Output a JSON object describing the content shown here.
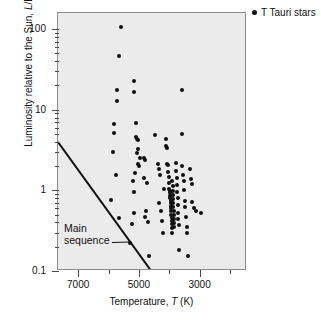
{
  "figure": {
    "background": "#ffffff",
    "plot_background": "#ebebeb",
    "frame_color": "#8c8c8c",
    "marker_color": "#111111"
  },
  "legend": {
    "position": "top-right-outside",
    "marker": "filled-circle",
    "label": "T Tauri stars"
  },
  "annotation": {
    "main_sequence": {
      "line1": "Main",
      "line2": "sequence"
    }
  },
  "chart_data": {
    "type": "scatter",
    "title": "",
    "subtitle": "",
    "xlabel": "Temperature, T (K)",
    "ylabel": "Luminosity relative to the Sun, L/L⊙",
    "xlabel_parts": {
      "pre": "Temperature, ",
      "italic": "T",
      "post": " (K)"
    },
    "ylabel_parts": {
      "pre": "Luminosity relative to the Sun, ",
      "italic": "L",
      "post": "/L⊙"
    },
    "xscale": "linear",
    "yscale": "log",
    "x_axis_reversed": true,
    "xlim": [
      7700,
      1470
    ],
    "ylim": [
      0.1,
      158
    ],
    "xticks": [
      7000,
      5000,
      3000
    ],
    "xtick_labels": [
      "7000",
      "5000",
      "3000"
    ],
    "xticks_minor": [
      6000,
      4000,
      2000
    ],
    "yticks": [
      100,
      10,
      1,
      0.1
    ],
    "ytick_labels": [
      "100",
      "10",
      "1",
      "0.1"
    ],
    "yticks_minor": [
      90,
      80,
      70,
      60,
      50,
      40,
      30,
      20,
      9,
      8,
      7,
      6,
      5,
      4,
      3,
      2,
      0.9,
      0.8,
      0.7,
      0.6,
      0.5,
      0.4,
      0.3,
      0.2
    ],
    "grid": false,
    "legend_position": "upper right, outside axes",
    "series": [
      {
        "name": "T Tauri stars",
        "marker": "filled-circle",
        "color": "#111111",
        "n_points": 108,
        "points": [
          [
            5630,
            105
          ],
          [
            5700,
            47
          ],
          [
            5760,
            17.5
          ],
          [
            5760,
            13.0
          ],
          [
            5840,
            5.2
          ],
          [
            5870,
            6.6
          ],
          [
            5900,
            3.0
          ],
          [
            5700,
            0.46
          ],
          [
            5790,
            1.55
          ],
          [
            5940,
            0.76
          ],
          [
            5200,
            23.0
          ],
          [
            5200,
            16.5
          ],
          [
            5130,
            6.9
          ],
          [
            5140,
            4.6
          ],
          [
            5110,
            4.3
          ],
          [
            5070,
            4.2
          ],
          [
            5050,
            3.3
          ],
          [
            5090,
            2.9
          ],
          [
            5000,
            2.5
          ],
          [
            5060,
            2.1
          ],
          [
            5020,
            2.0
          ],
          [
            5150,
            1.62
          ],
          [
            5230,
            1.3
          ],
          [
            5180,
            0.95
          ],
          [
            5210,
            0.52
          ],
          [
            5270,
            0.38
          ],
          [
            5330,
            0.22
          ],
          [
            4880,
            2.5
          ],
          [
            4820,
            2.4
          ],
          [
            4860,
            1.42
          ],
          [
            4760,
            1.25
          ],
          [
            4800,
            0.56
          ],
          [
            4830,
            0.47
          ],
          [
            4750,
            0.41
          ],
          [
            4710,
            0.155
          ],
          [
            4500,
            4.8
          ],
          [
            4420,
            2.1
          ],
          [
            4380,
            1.85
          ],
          [
            4330,
            1.55
          ],
          [
            4360,
            0.7
          ],
          [
            4300,
            0.55
          ],
          [
            4270,
            0.42
          ],
          [
            4250,
            0.3
          ],
          [
            4220,
            1.05
          ],
          [
            4150,
            4.3
          ],
          [
            4130,
            3.6
          ],
          [
            4100,
            3.4
          ],
          [
            4120,
            2.15
          ],
          [
            4080,
            2.05
          ],
          [
            4060,
            1.7
          ],
          [
            4050,
            1.45
          ],
          [
            4040,
            1.22
          ],
          [
            4030,
            1.05
          ],
          [
            4020,
            0.98
          ],
          [
            4010,
            0.92
          ],
          [
            4000,
            0.86
          ],
          [
            3995,
            0.8
          ],
          [
            3990,
            0.74
          ],
          [
            3985,
            0.69
          ],
          [
            3980,
            0.64
          ],
          [
            3975,
            0.6
          ],
          [
            3970,
            0.55
          ],
          [
            3965,
            0.5
          ],
          [
            3960,
            0.46
          ],
          [
            3955,
            0.42
          ],
          [
            3950,
            0.38
          ],
          [
            3945,
            0.34
          ],
          [
            3940,
            0.3
          ],
          [
            3930,
            1.3
          ],
          [
            3920,
            1.12
          ],
          [
            3915,
            0.98
          ],
          [
            3910,
            0.88
          ],
          [
            3905,
            0.78
          ],
          [
            3900,
            0.7
          ],
          [
            3895,
            0.62
          ],
          [
            3890,
            0.56
          ],
          [
            3885,
            0.5
          ],
          [
            3880,
            0.44
          ],
          [
            3875,
            0.39
          ],
          [
            3870,
            0.35
          ],
          [
            3820,
            2.2
          ],
          [
            3800,
            1.75
          ],
          [
            3790,
            1.42
          ],
          [
            3780,
            1.18
          ],
          [
            3770,
            0.96
          ],
          [
            3760,
            0.8
          ],
          [
            3750,
            0.66
          ],
          [
            3740,
            0.52
          ],
          [
            3730,
            0.44
          ],
          [
            3720,
            0.37
          ],
          [
            3700,
            0.185
          ],
          [
            3620,
            5.0
          ],
          [
            3600,
            2.0
          ],
          [
            3580,
            1.55
          ],
          [
            3560,
            1.3
          ],
          [
            3540,
            1.02
          ],
          [
            3520,
            0.74
          ],
          [
            3500,
            0.62
          ],
          [
            3480,
            0.47
          ],
          [
            3460,
            0.35
          ],
          [
            3440,
            0.3
          ],
          [
            3400,
            0.155
          ],
          [
            3340,
            1.85
          ],
          [
            3320,
            1.4
          ],
          [
            3300,
            1.2
          ],
          [
            3280,
            0.72
          ],
          [
            3230,
            0.6
          ],
          [
            3150,
            0.56
          ],
          [
            3000,
            0.52
          ],
          [
            3620,
            17.5
          ]
        ]
      }
    ],
    "reference_line": {
      "name": "Main sequence",
      "type": "line",
      "x": [
        7700,
        4600
      ],
      "y": [
        4.1,
        0.1
      ]
    }
  }
}
